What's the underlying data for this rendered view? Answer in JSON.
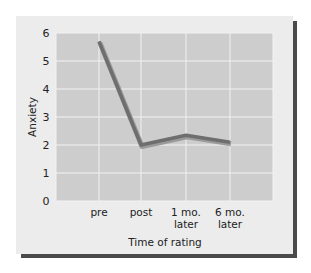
{
  "chart_data": {
    "type": "line",
    "title": "",
    "xlabel": "Time of rating",
    "ylabel": "Anxiety",
    "categories": [
      "pre",
      "post",
      "1 mo. later",
      "6 mo. later"
    ],
    "category_lines": [
      [
        "pre"
      ],
      [
        "post"
      ],
      [
        "1 mo.",
        "later"
      ],
      [
        "6 mo.",
        "later"
      ]
    ],
    "values": [
      5.7,
      2.0,
      2.35,
      2.1
    ],
    "ylim": [
      0,
      6
    ],
    "yticks": [
      "0",
      "1",
      "2",
      "3",
      "4",
      "5",
      "6"
    ],
    "grid": true,
    "legend": null
  },
  "colors": {
    "line": "#6e6e6e",
    "plot_bg": "#cdcdcd",
    "grid": "#f2f2f2",
    "panel": "#ececec",
    "shadow": "#4a4a4a"
  }
}
